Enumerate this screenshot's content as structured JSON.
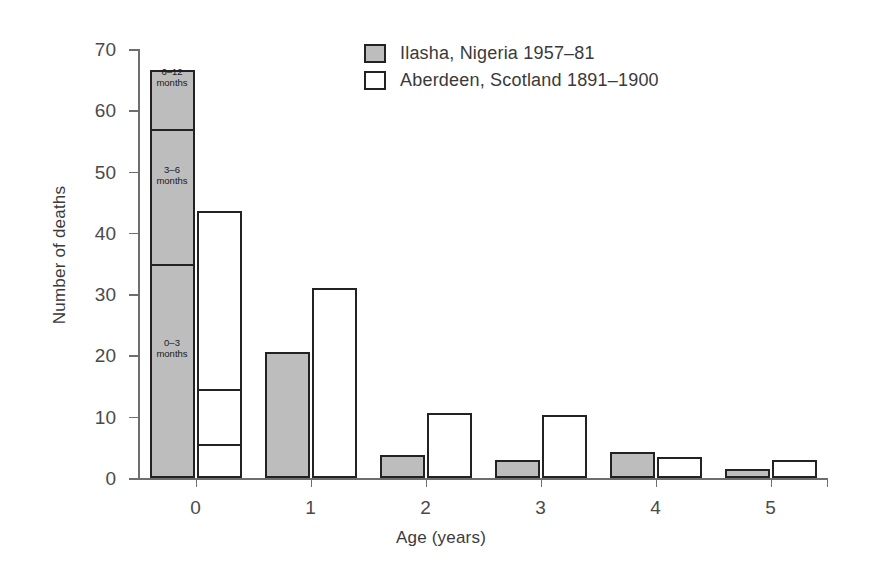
{
  "chart_data": {
    "type": "bar",
    "title": "",
    "xlabel": "Age (years)",
    "ylabel": "Number of deaths",
    "categories": [
      "0",
      "1",
      "2",
      "3",
      "4",
      "5"
    ],
    "xtick_labels": [
      "0",
      "1",
      "2",
      "3",
      "4",
      "5"
    ],
    "ytick_labels": [
      "0",
      "10",
      "20",
      "30",
      "40",
      "50",
      "60",
      "70"
    ],
    "ylim": [
      0,
      70
    ],
    "ytick_step": 10,
    "grid": false,
    "legend_position": "top-center",
    "series": [
      {
        "name": "Ilasha, Nigeria 1957–81",
        "color": "#bdbdbd",
        "values": [
          66.5,
          20.5,
          3.8,
          3.0,
          4.2,
          1.4
        ]
      },
      {
        "name": "Aberdeen, Scotland 1891–1900",
        "color": "#ffffff",
        "values": [
          43.5,
          31.0,
          10.6,
          10.3,
          3.4,
          3.0
        ]
      }
    ],
    "stacked_detail": {
      "note": "Age 0 bars are subdivided into infant age-at-death bands",
      "ilasha_age0_segments": [
        {
          "label_line1": "0–3",
          "label_line2": "months",
          "from": 0,
          "to": 34.5
        },
        {
          "label_line1": "3–6",
          "label_line2": "months",
          "from": 34.5,
          "to": 56.5
        },
        {
          "label_line1": "6–12",
          "label_line2": "months",
          "from": 56.5,
          "to": 66.5
        }
      ],
      "aberdeen_age0_segments": [
        {
          "label_line1": "",
          "label_line2": "",
          "from": 0,
          "to": 5.0
        },
        {
          "label_line1": "",
          "label_line2": "",
          "from": 5.0,
          "to": 14.0
        },
        {
          "label_line1": "",
          "label_line2": "",
          "from": 14.0,
          "to": 43.5
        }
      ]
    }
  },
  "legend": {
    "items": [
      {
        "label": "Ilasha, Nigeria 1957–81",
        "swatch": "gray"
      },
      {
        "label": "Aberdeen, Scotland 1891–1900",
        "swatch": "white"
      }
    ]
  },
  "colors": {
    "series_gray": "#bdbdbd",
    "series_white": "#ffffff",
    "outline": "#222222",
    "axis": "#6e6e6e",
    "text": "#3a3a3a"
  }
}
